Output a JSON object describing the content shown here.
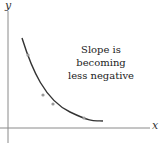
{
  "diagram": {
    "y_axis_label": "y",
    "x_axis_label": "x",
    "annotation_lines": [
      "Slope is",
      "becoming",
      "less negative"
    ],
    "colors": {
      "axis": "#888888",
      "curve": "#333333",
      "markers": "#999999",
      "text": "#222222"
    },
    "curve_description": "decreasing convex curve",
    "curve_points": [
      [
        22,
        38
      ],
      [
        28,
        55
      ],
      [
        40,
        85
      ],
      [
        52,
        100
      ],
      [
        70,
        112
      ],
      [
        85,
        118
      ],
      [
        103,
        121
      ]
    ]
  }
}
